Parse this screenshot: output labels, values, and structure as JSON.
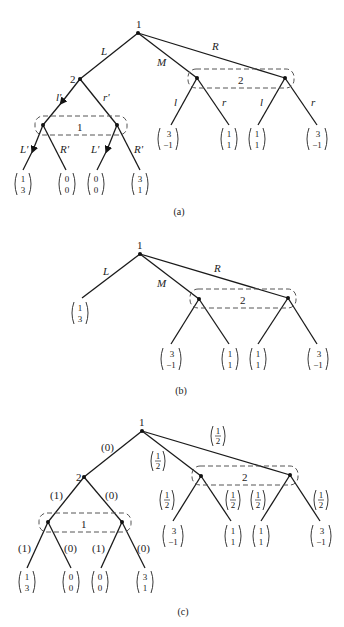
{
  "figure": {
    "panels": [
      {
        "caption": "(a)",
        "root_player": "1",
        "root_actions": [
          "L",
          "M",
          "R"
        ],
        "player2_node_label": "2",
        "player2_actions_left": [
          "l'",
          "r'"
        ],
        "info_set_left_label": "1",
        "player1_actions_after": [
          "L'",
          "R'",
          "L'",
          "R'"
        ],
        "info_set_right_label": "2",
        "player2_actions_right": [
          "l",
          "r",
          "l",
          "r"
        ],
        "payoffs": [
          [
            "1",
            "3"
          ],
          [
            "0",
            "0"
          ],
          [
            "0",
            "0"
          ],
          [
            "3",
            "1"
          ],
          [
            "3",
            "-1"
          ],
          [
            "1",
            "1"
          ],
          [
            "1",
            "1"
          ],
          [
            "3",
            "-1"
          ]
        ]
      },
      {
        "caption": "(b)",
        "root_player": "1",
        "root_actions": [
          "L",
          "M",
          "R"
        ],
        "info_set_right_label": "2",
        "payoffs": [
          [
            "1",
            "3"
          ],
          [
            "3",
            "-1"
          ],
          [
            "1",
            "1"
          ],
          [
            "1",
            "1"
          ],
          [
            "3",
            "-1"
          ]
        ]
      },
      {
        "caption": "(c)",
        "root_player": "1",
        "root_probs": [
          "(0)",
          "1/2",
          "1/2"
        ],
        "player2_node_label": "2",
        "player2_probs_left": [
          "(1)",
          "(0)"
        ],
        "info_set_left_label": "1",
        "player1_probs_after": [
          "(1)",
          "(0)",
          "(1)",
          "(0)"
        ],
        "info_set_right_label": "2",
        "player2_probs_right": [
          "1/2",
          "1/2",
          "1/2",
          "1/2"
        ],
        "payoffs": [
          [
            "1",
            "3"
          ],
          [
            "0",
            "0"
          ],
          [
            "0",
            "0"
          ],
          [
            "3",
            "1"
          ],
          [
            "3",
            "-1"
          ],
          [
            "1",
            "1"
          ],
          [
            "1",
            "1"
          ],
          [
            "3",
            "-1"
          ]
        ]
      }
    ]
  }
}
